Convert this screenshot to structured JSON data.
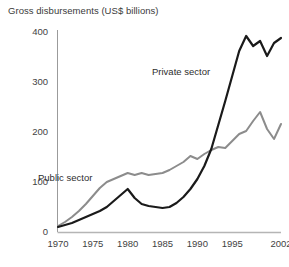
{
  "chart_data": {
    "type": "line",
    "title": "Gross disbursements (US$ billions)",
    "xlabel": "",
    "ylabel": "",
    "xlim": [
      1970,
      2002
    ],
    "ylim": [
      0,
      400
    ],
    "grid": false,
    "legend_position": "inline-annotations",
    "x_ticks": [
      "1970",
      "1975",
      "1980",
      "1985",
      "1990",
      "1995",
      "2002"
    ],
    "x_tick_values": [
      1970,
      1975,
      1980,
      1985,
      1990,
      1995,
      2002
    ],
    "y_ticks": [
      "0",
      "100",
      "200",
      "300",
      "400"
    ],
    "y_tick_values": [
      0,
      100,
      200,
      300,
      400
    ],
    "x": [
      1970,
      1971,
      1972,
      1973,
      1974,
      1975,
      1976,
      1977,
      1978,
      1979,
      1980,
      1981,
      1982,
      1983,
      1984,
      1985,
      1986,
      1987,
      1988,
      1989,
      1990,
      1991,
      1992,
      1993,
      1994,
      1995,
      1996,
      1997,
      1998,
      1999,
      2000,
      2001,
      2002
    ],
    "series": [
      {
        "name": "Private sector",
        "color": "#1a1a1a",
        "values": [
          10,
          14,
          18,
          24,
          30,
          36,
          42,
          50,
          62,
          74,
          86,
          68,
          56,
          52,
          50,
          48,
          50,
          58,
          70,
          86,
          106,
          132,
          166,
          214,
          262,
          312,
          362,
          392,
          372,
          382,
          352,
          378,
          388
        ]
      },
      {
        "name": "Public sector",
        "color": "#8c8c8c",
        "values": [
          12,
          20,
          30,
          42,
          56,
          72,
          88,
          100,
          106,
          112,
          118,
          114,
          118,
          114,
          116,
          118,
          124,
          132,
          140,
          152,
          146,
          156,
          164,
          170,
          168,
          182,
          196,
          202,
          222,
          240,
          206,
          186,
          216
        ]
      }
    ],
    "annotations": [
      {
        "text": "Private sector",
        "x": 1992,
        "y": 320
      },
      {
        "text": "Public sector",
        "x": 1972,
        "y": 118
      }
    ]
  }
}
